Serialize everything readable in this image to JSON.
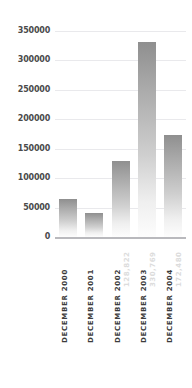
{
  "top_clipped_text": "..........",
  "chart_data": {
    "type": "bar",
    "title": "",
    "subtitle": "",
    "xlabel": "",
    "ylabel": "",
    "categories": [
      "DECEMBER 2000",
      "DECEMBER 2001",
      "DECEMBER 2002",
      "DECEMBER 2003",
      "DECEMBER 2004"
    ],
    "values": [
      64000,
      41000,
      128822,
      330769,
      172480
    ],
    "point_labels": [
      "",
      "",
      "128,822",
      "330,769",
      "172,480"
    ],
    "ylim": [
      0,
      350000
    ],
    "ytick_values": [
      0,
      50000,
      100000,
      150000,
      200000,
      250000,
      300000,
      350000
    ],
    "ytick_labels": [
      "0",
      "50000",
      "100000",
      "150000",
      "200000",
      "250000",
      "300000",
      "350000"
    ],
    "grid": true,
    "grid_axis": "y",
    "legend": false,
    "legend_position": "none",
    "bar_color_top": "#8f8f8f",
    "bar_color_bottom": "#fdfdfd",
    "gridline_color": "#e9e9ec",
    "axis_color": "#b9b9bd",
    "tick_label_color": "#4a4a4a",
    "category_label_color": "#3c3c3c",
    "value_label_color": "#dcdcdc"
  }
}
